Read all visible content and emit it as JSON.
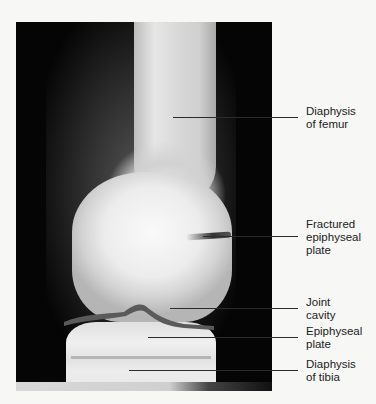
{
  "figure": {
    "labels": [
      {
        "id": "femur",
        "lines": [
          "Diaphysis",
          "of femur"
        ]
      },
      {
        "id": "fractured",
        "lines": [
          "Fractured",
          "epiphyseal",
          "plate"
        ]
      },
      {
        "id": "joint",
        "lines": [
          "Joint",
          "cavity"
        ]
      },
      {
        "id": "epiphyseal",
        "lines": [
          "Epiphyseal",
          "plate"
        ]
      },
      {
        "id": "tibia",
        "lines": [
          "Diaphysis",
          "of tibia"
        ]
      }
    ]
  }
}
